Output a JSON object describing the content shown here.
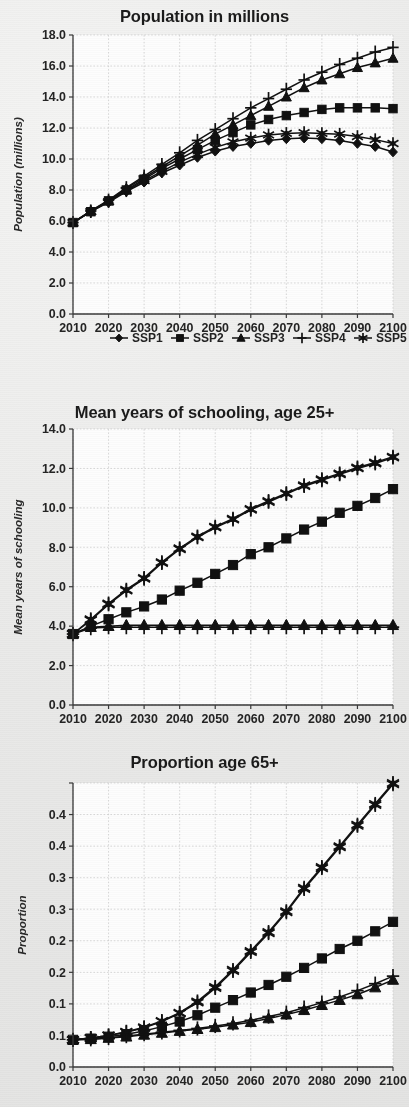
{
  "figure": {
    "legend_labels": [
      "SSP1",
      "SSP2",
      "SSP3",
      "SSP4",
      "SSP5"
    ],
    "marker_names": [
      "diamond",
      "square",
      "triangle",
      "plus",
      "asterisk"
    ],
    "series_color": "#111111"
  },
  "chart_data": [
    {
      "id": "population",
      "type": "line",
      "title": "Population in millions",
      "xlabel": "",
      "ylabel": "Population (millions)",
      "x": [
        2010,
        2015,
        2020,
        2025,
        2030,
        2035,
        2040,
        2045,
        2050,
        2055,
        2060,
        2065,
        2070,
        2075,
        2080,
        2085,
        2090,
        2095,
        2100
      ],
      "xticks": [
        2010,
        2020,
        2030,
        2040,
        2050,
        2060,
        2070,
        2080,
        2090,
        2100
      ],
      "yticks": [
        0.0,
        2.0,
        4.0,
        6.0,
        8.0,
        10.0,
        12.0,
        14.0,
        16.0,
        18.0
      ],
      "ytick_labels": [
        "0.0",
        "2.0",
        "4.0",
        "6.0",
        "8.0",
        "10.0",
        "12.0",
        "14.0",
        "16.0",
        "18.0"
      ],
      "xtick_labels": [
        "2010",
        "2020",
        "2030",
        "2040",
        "2050",
        "2060",
        "2070",
        "2080",
        "2090",
        "2100"
      ],
      "ylim": [
        0.0,
        18.0
      ],
      "xlim": [
        2010,
        2100
      ],
      "grid": true,
      "legend_position": "below",
      "series": [
        {
          "name": "SSP1",
          "marker": "diamond",
          "values": [
            5.9,
            6.6,
            7.2,
            7.9,
            8.5,
            9.1,
            9.6,
            10.1,
            10.5,
            10.8,
            11.0,
            11.2,
            11.3,
            11.35,
            11.3,
            11.2,
            11.0,
            10.8,
            10.45
          ]
        },
        {
          "name": "SSP2",
          "marker": "square",
          "values": [
            5.9,
            6.6,
            7.3,
            8.0,
            8.7,
            9.4,
            10.0,
            10.6,
            11.2,
            11.7,
            12.2,
            12.55,
            12.8,
            13.0,
            13.2,
            13.3,
            13.3,
            13.3,
            13.25
          ]
        },
        {
          "name": "SSP3",
          "marker": "triangle",
          "values": [
            5.9,
            6.65,
            7.3,
            8.1,
            8.8,
            9.5,
            10.2,
            10.9,
            11.6,
            12.2,
            12.8,
            13.4,
            14.0,
            14.6,
            15.1,
            15.5,
            15.9,
            16.2,
            16.5
          ]
        },
        {
          "name": "SSP4",
          "marker": "plus",
          "values": [
            5.9,
            6.65,
            7.35,
            8.15,
            8.9,
            9.65,
            10.4,
            11.2,
            11.9,
            12.6,
            13.3,
            13.9,
            14.5,
            15.1,
            15.6,
            16.1,
            16.5,
            16.9,
            17.2
          ]
        },
        {
          "name": "SSP5",
          "marker": "asterisk",
          "values": [
            5.9,
            6.6,
            7.25,
            7.95,
            8.6,
            9.2,
            9.8,
            10.3,
            10.75,
            11.1,
            11.35,
            11.55,
            11.65,
            11.7,
            11.65,
            11.6,
            11.45,
            11.25,
            11.0
          ]
        }
      ]
    },
    {
      "id": "schooling",
      "type": "line",
      "title": "Mean years of schooling, age 25+",
      "xlabel": "",
      "ylabel": "Mean years of schooling",
      "x": [
        2010,
        2015,
        2020,
        2025,
        2030,
        2035,
        2040,
        2045,
        2050,
        2055,
        2060,
        2065,
        2070,
        2075,
        2080,
        2085,
        2090,
        2095,
        2100
      ],
      "xticks": [
        2010,
        2020,
        2030,
        2040,
        2050,
        2060,
        2070,
        2080,
        2090,
        2100
      ],
      "yticks": [
        0.0,
        2.0,
        4.0,
        6.0,
        8.0,
        10.0,
        12.0,
        14.0
      ],
      "ytick_labels": [
        "0.0",
        "2.0",
        "4.0",
        "6.0",
        "8.0",
        "10.0",
        "12.0",
        "14.0"
      ],
      "xtick_labels": [
        "2010",
        "2020",
        "2030",
        "2040",
        "2050",
        "2060",
        "2070",
        "2080",
        "2090",
        "2100"
      ],
      "ylim": [
        0.0,
        14.0
      ],
      "xlim": [
        2010,
        2100
      ],
      "grid": true,
      "legend_position": "none",
      "series": [
        {
          "name": "SSP1",
          "marker": "asterisk",
          "values": [
            3.6,
            4.3,
            5.1,
            5.8,
            6.4,
            7.2,
            7.9,
            8.5,
            9.0,
            9.4,
            9.9,
            10.3,
            10.7,
            11.1,
            11.4,
            11.7,
            12.0,
            12.25,
            12.55
          ]
        },
        {
          "name": "SSP2",
          "marker": "square",
          "values": [
            3.6,
            4.0,
            4.35,
            4.7,
            5.0,
            5.35,
            5.8,
            6.2,
            6.65,
            7.1,
            7.65,
            8.0,
            8.45,
            8.9,
            9.3,
            9.75,
            10.1,
            10.5,
            10.95
          ]
        },
        {
          "name": "SSP3",
          "marker": "triangle",
          "values": [
            3.6,
            3.95,
            4.0,
            4.05,
            4.05,
            4.05,
            4.05,
            4.05,
            4.05,
            4.05,
            4.05,
            4.05,
            4.05,
            4.05,
            4.05,
            4.05,
            4.05,
            4.05,
            4.05
          ]
        },
        {
          "name": "SSP4",
          "marker": "plus",
          "values": [
            3.6,
            3.9,
            3.95,
            3.95,
            3.95,
            3.95,
            3.95,
            3.95,
            3.95,
            3.95,
            3.95,
            3.95,
            3.95,
            3.95,
            3.95,
            3.95,
            3.95,
            3.95,
            3.95
          ]
        },
        {
          "name": "SSP5",
          "marker": "asterisk",
          "values": [
            3.6,
            4.35,
            5.15,
            5.85,
            6.45,
            7.25,
            7.95,
            8.55,
            9.05,
            9.45,
            9.95,
            10.35,
            10.75,
            11.15,
            11.45,
            11.75,
            12.05,
            12.3,
            12.6
          ]
        }
      ]
    },
    {
      "id": "proportion65",
      "type": "line",
      "title": "Proportion age 65+",
      "xlabel": "",
      "ylabel": "Proportion",
      "x": [
        2010,
        2015,
        2020,
        2025,
        2030,
        2035,
        2040,
        2045,
        2050,
        2055,
        2060,
        2065,
        2070,
        2075,
        2080,
        2085,
        2090,
        2095,
        2100
      ],
      "xticks": [
        2010,
        2020,
        2030,
        2040,
        2050,
        2060,
        2070,
        2080,
        2090,
        2100
      ],
      "yticks": [
        0.0,
        0.05,
        0.1,
        0.15,
        0.2,
        0.25,
        0.3,
        0.35,
        0.4,
        0.45
      ],
      "ytick_labels": [
        "0.0",
        "0.1",
        "0.1",
        "0.2",
        "0.2",
        "0.3",
        "0.3",
        "0.4",
        "0.4"
      ],
      "xtick_labels": [
        "2010",
        "2020",
        "2030",
        "2040",
        "2050",
        "2060",
        "2070",
        "2080",
        "2090",
        "2100"
      ],
      "ylim": [
        0.0,
        0.45
      ],
      "xlim": [
        2010,
        2100
      ],
      "grid": true,
      "legend_position": "none",
      "series": [
        {
          "name": "SSP1",
          "marker": "asterisk",
          "values": [
            0.043,
            0.046,
            0.05,
            0.055,
            0.062,
            0.072,
            0.085,
            0.102,
            0.125,
            0.152,
            0.182,
            0.212,
            0.245,
            0.282,
            0.315,
            0.348,
            0.382,
            0.415,
            0.448
          ]
        },
        {
          "name": "SSP2",
          "marker": "square",
          "values": [
            0.043,
            0.045,
            0.048,
            0.052,
            0.057,
            0.064,
            0.072,
            0.082,
            0.094,
            0.106,
            0.118,
            0.13,
            0.143,
            0.157,
            0.172,
            0.187,
            0.2,
            0.215,
            0.23
          ]
        },
        {
          "name": "SSP3",
          "marker": "triangle",
          "values": [
            0.043,
            0.044,
            0.046,
            0.048,
            0.051,
            0.054,
            0.057,
            0.06,
            0.063,
            0.067,
            0.071,
            0.077,
            0.083,
            0.09,
            0.098,
            0.106,
            0.115,
            0.126,
            0.138
          ]
        },
        {
          "name": "SSP4",
          "marker": "plus",
          "values": [
            0.043,
            0.044,
            0.046,
            0.049,
            0.052,
            0.055,
            0.058,
            0.061,
            0.065,
            0.069,
            0.074,
            0.08,
            0.086,
            0.094,
            0.102,
            0.111,
            0.121,
            0.132,
            0.144
          ]
        },
        {
          "name": "SSP5",
          "marker": "asterisk",
          "values": [
            0.043,
            0.046,
            0.05,
            0.056,
            0.063,
            0.073,
            0.086,
            0.104,
            0.127,
            0.154,
            0.184,
            0.214,
            0.247,
            0.284,
            0.317,
            0.35,
            0.384,
            0.417,
            0.45
          ]
        }
      ]
    }
  ]
}
